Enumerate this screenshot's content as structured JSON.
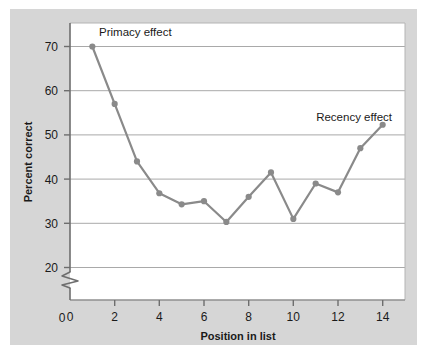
{
  "figure": {
    "panel_background": "#d6d6d6",
    "plot_background": "#ffffff",
    "page_background": "#ffffff"
  },
  "chart_data": {
    "type": "line",
    "title": "",
    "xlabel": "Position in list",
    "ylabel": "Percent correct",
    "x": [
      1,
      2,
      3,
      4,
      5,
      6,
      7,
      8,
      9,
      10,
      11,
      12,
      13,
      14
    ],
    "values": [
      70.0,
      57.0,
      44.0,
      36.8,
      34.3,
      35.0,
      30.3,
      36.0,
      41.5,
      31.0,
      39.0,
      37.0,
      47.0,
      52.3
    ],
    "series": [
      {
        "name": "Percent correct",
        "values": [
          70.0,
          57.0,
          44.0,
          36.8,
          34.3,
          35.0,
          30.3,
          36.0,
          41.5,
          31.0,
          39.0,
          37.0,
          47.0,
          52.3
        ],
        "color": "#8a8a8a"
      }
    ],
    "xlim": [
      0,
      15
    ],
    "ylim": [
      18,
      74
    ],
    "xticks": [
      0,
      2,
      4,
      6,
      8,
      10,
      12,
      14
    ],
    "xtick_labels": [
      "0",
      "2",
      "4",
      "6",
      "8",
      "10",
      "12",
      "14"
    ],
    "yticks": [
      20,
      30,
      40,
      50,
      60,
      70
    ],
    "ytick_labels": [
      "20",
      "30",
      "40",
      "50",
      "60",
      "70"
    ],
    "y_axis_break": true,
    "y_origin_label": "0",
    "grid": "horizontal",
    "legend": "none",
    "line_color": "#8a8a8a",
    "marker_color": "#8a8a8a",
    "marker": "circle",
    "annotations": [
      {
        "text": "Primacy effect",
        "x": 1.35,
        "y": 73.2,
        "anchor": "start"
      },
      {
        "text": "Recency effect",
        "x": 14.35,
        "y": 57.0,
        "anchor": "end"
      }
    ]
  }
}
